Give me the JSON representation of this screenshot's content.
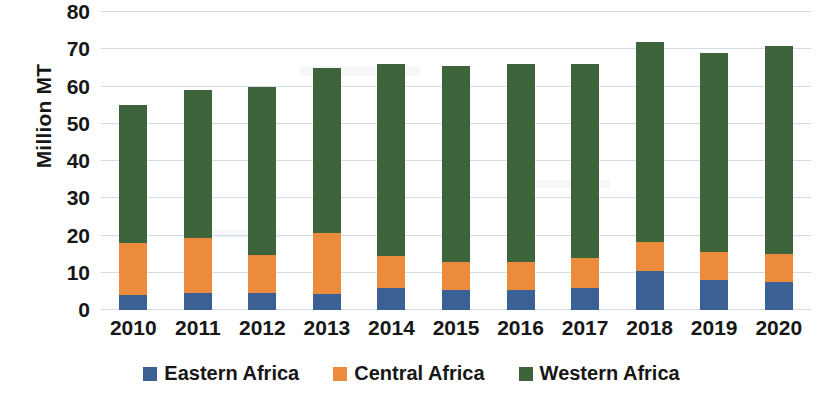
{
  "chart_data": {
    "type": "bar",
    "stacked": true,
    "title": "",
    "xlabel": "",
    "ylabel": "Million MT",
    "ylim": [
      0,
      80
    ],
    "yticks": [
      0,
      10,
      20,
      30,
      40,
      50,
      60,
      70,
      80
    ],
    "grid": true,
    "legend_position": "bottom",
    "categories": [
      "2010",
      "2011",
      "2012",
      "2013",
      "2014",
      "2015",
      "2016",
      "2017",
      "2018",
      "2019",
      "2020"
    ],
    "series": [
      {
        "name": "Eastern Africa",
        "color": "#3B6093",
        "values": [
          4,
          4.5,
          4.5,
          4.3,
          6,
          5.4,
          5.4,
          6,
          10.5,
          8,
          7.5
        ]
      },
      {
        "name": "Central Africa",
        "color": "#ED8B3C",
        "values": [
          14,
          14.9,
          10.3,
          16.4,
          8.5,
          7.6,
          7.6,
          8,
          7.8,
          7.6,
          7.5
        ]
      },
      {
        "name": "Western Africa",
        "color": "#3E643C",
        "values": [
          37,
          39.6,
          45.2,
          44.3,
          51.5,
          52.5,
          53,
          52,
          53.7,
          53.4,
          56
        ]
      }
    ],
    "totals": [
      55,
      59,
      60,
      65,
      66,
      65.5,
      66,
      66,
      72,
      69,
      71
    ]
  }
}
